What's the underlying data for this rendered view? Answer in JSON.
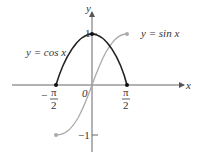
{
  "diagram": {
    "axes": {
      "x_label": "x",
      "y_label": "y",
      "origin_label": "0"
    },
    "ticks": {
      "neg_half_pi": {
        "sign": "−",
        "num": "π",
        "den": "2"
      },
      "pos_half_pi": {
        "num": "π",
        "den": "2"
      },
      "y_one": "1",
      "y_neg_one": "−1"
    },
    "curves": [
      {
        "name": "cos",
        "label": "y = cos x",
        "color": "#222222",
        "domain": [
          "-π/2",
          "π/2"
        ]
      },
      {
        "name": "sin",
        "label": "y = sin x",
        "color": "#aaaaaa",
        "domain": [
          "-π/2",
          "π/2"
        ]
      }
    ]
  }
}
